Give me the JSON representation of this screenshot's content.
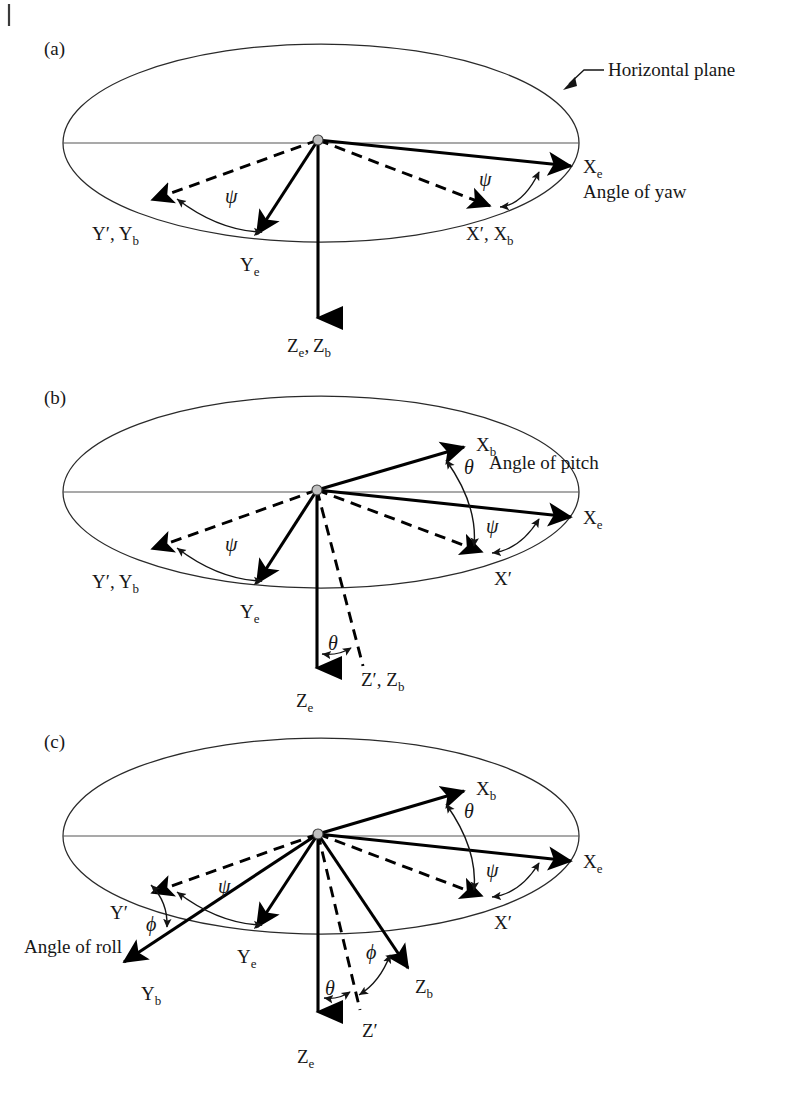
{
  "figure": {
    "type": "euler-angle-rotation-diagram",
    "panel_count": 3,
    "margin_mark": "|"
  },
  "panels": [
    {
      "id": "(a)",
      "name": "yaw",
      "callout": "Horizontal plane",
      "angle_caption": "Angle of yaw",
      "labels": {
        "x_earth": "X",
        "x_earth_sub": "e",
        "x_prime_body": "X′, X",
        "x_prime_body_sub": "b",
        "y_prime_body": "Y′, Y",
        "y_prime_body_sub": "b",
        "y_earth": "Y",
        "y_earth_sub": "e",
        "z_earth_body": "Z",
        "z_earth_body_sub": "e",
        "z_earth_body_2": ", Z",
        "z_earth_body_sub2": "b",
        "psi_left": "ψ",
        "psi_right": "ψ"
      }
    },
    {
      "id": "(b)",
      "name": "pitch",
      "angle_caption": "Angle of pitch",
      "labels": {
        "x_body": "X",
        "x_body_sub": "b",
        "x_earth": "X",
        "x_earth_sub": "e",
        "x_prime": "X′",
        "y_prime_body": "Y′, Y",
        "y_prime_body_sub": "b",
        "y_earth": "Y",
        "y_earth_sub": "e",
        "z_earth": "Z",
        "z_earth_sub": "e",
        "z_prime_body": "Z′, Z",
        "z_prime_body_sub": "b",
        "psi_left": "ψ",
        "psi_right": "ψ",
        "theta_top": "θ",
        "theta_bottom": "θ"
      }
    },
    {
      "id": "(c)",
      "name": "roll",
      "angle_caption": "Angle of roll",
      "labels": {
        "x_body": "X",
        "x_body_sub": "b",
        "x_earth": "X",
        "x_earth_sub": "e",
        "x_prime": "X′",
        "y_prime": "Y′",
        "y_body": "Y",
        "y_body_sub": "b",
        "y_earth": "Y",
        "y_earth_sub": "e",
        "z_body": "Z",
        "z_body_sub": "b",
        "z_prime": "Z′",
        "z_earth": "Z",
        "z_earth_sub": "e",
        "psi_left": "ψ",
        "psi_right": "ψ",
        "theta_top": "θ",
        "theta_bottom": "θ",
        "phi_left": "ϕ",
        "phi_bottom": "ϕ"
      }
    }
  ],
  "colors": {
    "ink": "#171717",
    "outline": "#2a2a2a",
    "diameter": "#555555",
    "hub": "#b9b9b9",
    "background": "#ffffff"
  }
}
